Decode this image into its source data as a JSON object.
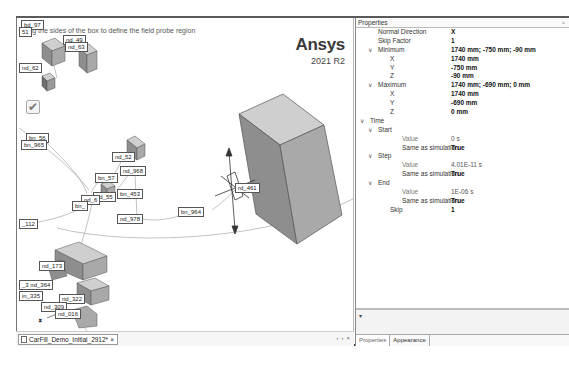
{
  "viewport": {
    "hint": "Drag the sides of the box to define the field probe region",
    "brand": {
      "name": "Ansys",
      "version": "2021 R2"
    },
    "labels": [
      {
        "text": "bd_97",
        "x": 4,
        "y": 2
      },
      {
        "text": "51",
        "x": 2,
        "y": 9
      },
      {
        "text": "nd_49",
        "x": 46,
        "y": 17
      },
      {
        "text": "nd_63",
        "x": 48,
        "y": 24
      },
      {
        "text": "nd_62",
        "x": 2,
        "y": 45
      },
      {
        "text": "bn_56",
        "x": 9,
        "y": 115
      },
      {
        "text": "bn_965",
        "x": 4,
        "y": 122
      },
      {
        "text": "nd_52",
        "x": 95,
        "y": 134
      },
      {
        "text": "nd_968",
        "x": 103,
        "y": 148
      },
      {
        "text": "bn_57",
        "x": 78,
        "y": 155
      },
      {
        "text": "nd_55",
        "x": 76,
        "y": 174
      },
      {
        "text": "nd_6",
        "x": 64,
        "y": 177
      },
      {
        "text": "bn_453",
        "x": 100,
        "y": 171
      },
      {
        "text": "bn_",
        "x": 55,
        "y": 183
      },
      {
        "text": "nd_978",
        "x": 100,
        "y": 196
      },
      {
        "text": "bn_964",
        "x": 161,
        "y": 189
      },
      {
        "text": "rd_461",
        "x": 218,
        "y": 165
      },
      {
        "text": "_112",
        "x": 2,
        "y": 201
      },
      {
        "text": "nd_173",
        "x": 22,
        "y": 243
      },
      {
        "text": "_3 nd_364",
        "x": 2,
        "y": 262
      },
      {
        "text": "in_335",
        "x": 2,
        "y": 273
      },
      {
        "text": "nd_322",
        "x": 42,
        "y": 276
      },
      {
        "text": "nd_309",
        "x": 24,
        "y": 284
      },
      {
        "text": "nd_016",
        "x": 38,
        "y": 291
      }
    ]
  },
  "document_tab": {
    "label": "CarFill_Demo_Initial_2912*",
    "close": "×",
    "nav": [
      "‹",
      "›",
      "×"
    ]
  },
  "properties": {
    "title": "Properties",
    "pin": "⁎",
    "rows": [
      {
        "key": "Normal Direction",
        "value": "X",
        "indent": 1,
        "expander": false
      },
      {
        "key": "Skip Factor",
        "value": "1",
        "indent": 1,
        "expander": false
      },
      {
        "key": "Minimum",
        "value": "1740 mm; -750 mm; -90 mm",
        "indent": 1,
        "expander": true
      },
      {
        "key": "X",
        "value": "1740 mm",
        "indent": 2,
        "expander": false
      },
      {
        "key": "Y",
        "value": "-750 mm",
        "indent": 2,
        "expander": false
      },
      {
        "key": "Z",
        "value": "-90 mm",
        "indent": 2,
        "expander": false
      },
      {
        "key": "Maximum",
        "value": "1740 mm; -690 mm; 0 mm",
        "indent": 1,
        "expander": true
      },
      {
        "key": "X",
        "value": "1740 mm",
        "indent": 2,
        "expander": false
      },
      {
        "key": "Y",
        "value": "-690 mm",
        "indent": 2,
        "expander": false
      },
      {
        "key": "Z",
        "value": "0 mm",
        "indent": 2,
        "expander": false
      },
      {
        "key": "Time",
        "value": "",
        "indent": 0,
        "expander": true
      },
      {
        "key": "Start",
        "value": "",
        "indent": 1,
        "expander": true
      },
      {
        "key": "Value",
        "value": "0 s",
        "indent": 3,
        "expander": false,
        "light": true
      },
      {
        "key": "Same as simulation",
        "value": "True",
        "indent": 3,
        "expander": false
      },
      {
        "key": "Step",
        "value": "",
        "indent": 1,
        "expander": true
      },
      {
        "key": "Value",
        "value": "4.01E-11 s",
        "indent": 3,
        "expander": false,
        "light": true
      },
      {
        "key": "Same as simulation",
        "value": "True",
        "indent": 3,
        "expander": false
      },
      {
        "key": "End",
        "value": "",
        "indent": 1,
        "expander": true
      },
      {
        "key": "Value",
        "value": "1E-06 s",
        "indent": 3,
        "expander": false,
        "light": true
      },
      {
        "key": "Same as simulation",
        "value": "True",
        "indent": 3,
        "expander": false
      },
      {
        "key": "Skip",
        "value": "1",
        "indent": 2,
        "expander": false
      }
    ],
    "description_expander": "▾",
    "tabs": [
      "Properties",
      "Appearance"
    ]
  },
  "colors": {
    "box_top": "#cfcfcf",
    "box_left": "#8e8e8e",
    "box_right": "#a9a9a9",
    "border": "#555555"
  }
}
